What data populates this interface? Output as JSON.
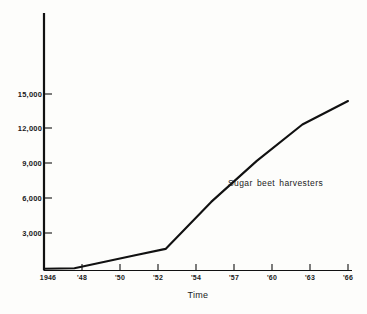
{
  "chart_data": {
    "type": "line",
    "title": "",
    "subtitle": "",
    "xlabel": "Time",
    "ylabel": "",
    "grid": false,
    "legend_position": "inline-annotation",
    "x": [
      1946,
      1948,
      1950,
      1952,
      1954,
      1957,
      1960,
      1963,
      1966
    ],
    "xtick_labels": [
      "1946",
      "'48",
      "'50",
      "'52",
      "'54",
      "'57",
      "'60",
      "'63",
      "'66"
    ],
    "ytick_labels": [
      "3,000",
      "6,000",
      "9,000",
      "12,000",
      "15,000"
    ],
    "yticks": [
      3000,
      6000,
      9000,
      12000,
      15000
    ],
    "ylim": [
      0,
      18500
    ],
    "xlim": [
      1946,
      1966
    ],
    "series": [
      {
        "name": "Sugar beet harvesters",
        "annotation": "Sugar beet harvesters",
        "color": "#111111",
        "values": [
          100,
          150,
          700,
          1250,
          1800,
          5800,
          9300,
          12400,
          14400
        ]
      }
    ],
    "annotations": [
      {
        "text": "Sugar beet harvesters",
        "x": 1958.6,
        "y": 7000
      }
    ]
  },
  "axes": {
    "y_axis_name": "value-axis",
    "x_axis_name": "time-axis"
  }
}
